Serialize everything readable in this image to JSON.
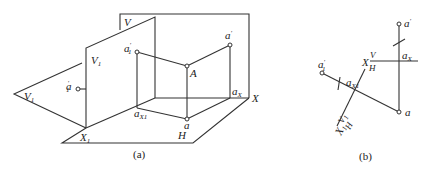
{
  "figure_a": {
    "caption": "(a)",
    "labels": {
      "V": "V",
      "V1": "V",
      "V1_sub": "1",
      "V1_rot": "V",
      "V1_rot_sub": "1",
      "a1_prime": "a",
      "a1_prime_sup": "′",
      "a1_prime_sub": "1",
      "a1_prime_vplane": "a",
      "a1_prime_vplane_sup": "′",
      "a1_prime_vplane_sub": "1",
      "A": "A",
      "a_prime": "a",
      "a_prime_sup": "′",
      "aX": "a",
      "aX_sub": "X",
      "aX1": "a",
      "aX1_sub": "X1",
      "a": "a",
      "H": "H",
      "X": "X",
      "X1": "X",
      "X1_sub": "1"
    }
  },
  "figure_b": {
    "caption": "(b)",
    "labels": {
      "a_prime": "a",
      "a_prime_sup": "′",
      "a1_prime": "a",
      "a1_prime_sup": "′",
      "a1_prime_sub": "1",
      "aX": "a",
      "aX_sub": "X",
      "aX1": "a",
      "aX1_sub": "X1",
      "a": "a",
      "X": "X",
      "V": "V",
      "H": "H",
      "X1": "X",
      "X1_sub": "1",
      "V1": "V",
      "V1_sub": "1",
      "H2": "H"
    }
  }
}
